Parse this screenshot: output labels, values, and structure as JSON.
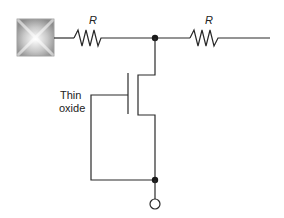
{
  "diagram": {
    "labels": {
      "resistor_left": "R",
      "resistor_right": "R",
      "oxide_line1": "Thin",
      "oxide_line2": "oxide"
    },
    "components": [
      {
        "type": "input-pad",
        "name": "bond pad"
      },
      {
        "type": "resistor",
        "label": "R"
      },
      {
        "type": "node",
        "name": "junction-top"
      },
      {
        "type": "resistor",
        "label": "R"
      },
      {
        "type": "mosfet",
        "name": "thin-oxide transistor"
      },
      {
        "type": "node",
        "name": "junction-bottom"
      },
      {
        "type": "terminal",
        "name": "output terminal"
      }
    ],
    "colors": {
      "wire": "#2a2a2a",
      "background": "#ffffff",
      "pad_light": "#f5f5f5",
      "pad_dark": "#8a8a8a"
    }
  }
}
